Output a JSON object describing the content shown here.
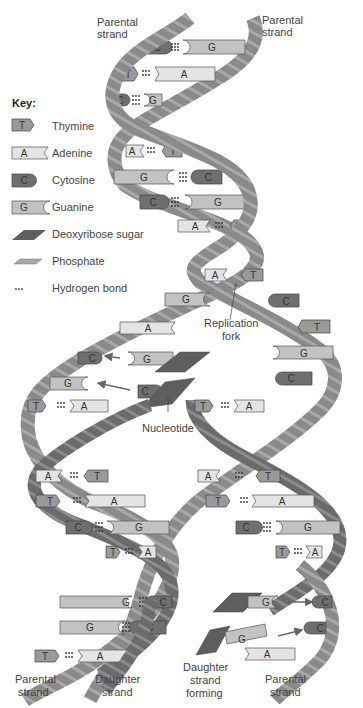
{
  "colors": {
    "strand": "#8a8a8a",
    "strand_dark": "#6e6e6e",
    "phosphate": "#b0b0b0",
    "thymine": "#9a9a9a",
    "adenine": "#e4e4e4",
    "cytosine": "#6f6f6f",
    "guanine": "#c2c2c2",
    "sugar": "#5e5e5e"
  },
  "labels": {
    "parental_top_left": [
      "Parental",
      "strand"
    ],
    "parental_top_right": [
      "Parental",
      "strand"
    ],
    "replication_fork": [
      "Replication",
      "fork"
    ],
    "nucleotide": "Nucleotide",
    "parental_bottom_left": [
      "Parental",
      "strand"
    ],
    "daughter_bottom": [
      "Daughter",
      "strand"
    ],
    "daughter_forming": [
      "Daughter",
      "strand",
      "forming"
    ],
    "parental_bottom_right": [
      "Parental",
      "strand"
    ]
  },
  "key": {
    "title": "Key:",
    "items": [
      {
        "symbol": "T",
        "label": "Thymine",
        "icon": "thymine-icon"
      },
      {
        "symbol": "A",
        "label": "Adenine",
        "icon": "adenine-icon"
      },
      {
        "symbol": "C",
        "label": "Cytosine",
        "icon": "cytosine-icon"
      },
      {
        "symbol": "G",
        "label": "Guanine",
        "icon": "guanine-icon"
      },
      {
        "symbol": "",
        "label": "Deoxyribose sugar",
        "icon": "sugar-icon"
      },
      {
        "symbol": "",
        "label": "Phosphate",
        "icon": "phosphate-icon"
      },
      {
        "symbol": "",
        "label": "Hydrogen bond",
        "icon": "hydrogen-bond-icon"
      }
    ]
  },
  "base_letters": {
    "T": "T",
    "A": "A",
    "C": "C",
    "G": "G"
  }
}
